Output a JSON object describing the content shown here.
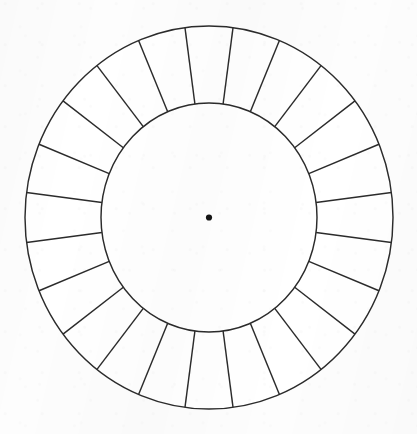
{
  "figure": {
    "type": "radial-segment-wheel",
    "background_color": "#fdfdfd",
    "line_color": "#2b2b2b",
    "fill_color": "#ffffff",
    "center_dot_color": "#151515"
  },
  "chart_data": {
    "type": "pie",
    "subtitle": "",
    "xlabel": "",
    "ylabel": "",
    "legend_position": "none",
    "grid": false,
    "segment_count": 24,
    "segment_angle_degrees": 15,
    "start_angle_degrees": 7.5,
    "categories": [
      "segment-1",
      "segment-2",
      "segment-3",
      "segment-4",
      "segment-5",
      "segment-6",
      "segment-7",
      "segment-8",
      "segment-9",
      "segment-10",
      "segment-11",
      "segment-12",
      "segment-13",
      "segment-14",
      "segment-15",
      "segment-16",
      "segment-17",
      "segment-18",
      "segment-19",
      "segment-20",
      "segment-21",
      "segment-22",
      "segment-23",
      "segment-24"
    ],
    "values": [
      15,
      15,
      15,
      15,
      15,
      15,
      15,
      15,
      15,
      15,
      15,
      15,
      15,
      15,
      15,
      15,
      15,
      15,
      15,
      15,
      15,
      15,
      15,
      15
    ],
    "labels": [],
    "annotations": []
  },
  "geometry": {
    "center_x": 209,
    "center_y": 217.5,
    "outer_radius_x": 184,
    "outer_radius_y": 191.5,
    "inner_radius_x": 108,
    "inner_radius_y": 114.5,
    "center_dot_radius": 3.1,
    "stroke_width": 1.45,
    "canvas_width": 417,
    "canvas_height": 434
  }
}
